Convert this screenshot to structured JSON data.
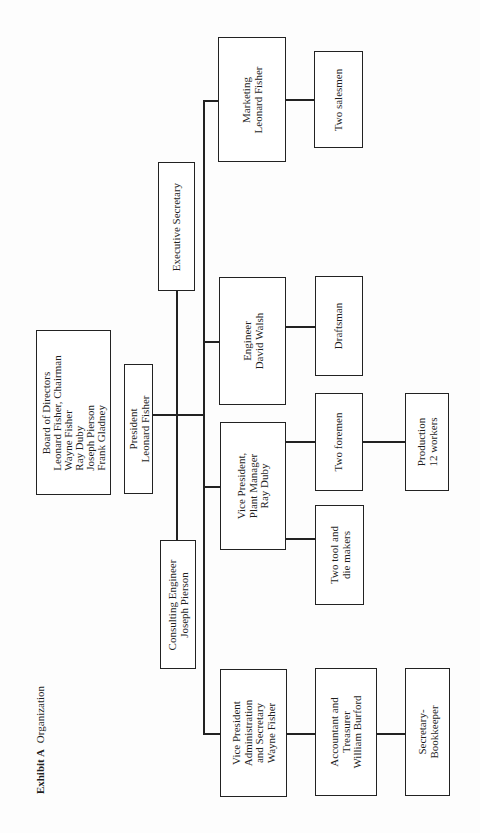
{
  "caption": {
    "label": "Exhibit A",
    "title": "Organization"
  },
  "nodes": {
    "board": {
      "title": "Board of Directors",
      "members": [
        "Leonard Fisher, Chairman",
        "Wayne Fisher",
        "Ray Duby",
        "Joseph Pierson",
        "Frank Gladney"
      ]
    },
    "president": {
      "lines": [
        "President",
        "Leonard Fisher"
      ]
    },
    "executive_secretary": {
      "lines": [
        "Executive Secretary"
      ]
    },
    "consulting_engineer": {
      "lines": [
        "Consulting Engineer",
        "Joseph Pierson"
      ]
    },
    "marketing": {
      "lines": [
        "Marketing",
        "Leonard Fisher"
      ]
    },
    "salesmen": {
      "lines": [
        "Two salesmen"
      ]
    },
    "engineer": {
      "lines": [
        "Engineer",
        "David Walsh"
      ]
    },
    "draftsman": {
      "lines": [
        "Draftsman"
      ]
    },
    "vp_plant": {
      "lines": [
        "Vice President,",
        "Plant Manager",
        "Ray Duby"
      ]
    },
    "foremen": {
      "lines": [
        "Two foremen"
      ]
    },
    "production": {
      "lines": [
        "Production",
        "12 workers"
      ]
    },
    "tool_die": {
      "lines": [
        "Two tool and",
        "die makers"
      ]
    },
    "vp_admin": {
      "lines": [
        "Vice President",
        "Administration",
        "and Secretary",
        "Wayne Fisher"
      ]
    },
    "accountant": {
      "lines": [
        "Accountant and",
        "Treasurer",
        "William Burford"
      ]
    },
    "bookkeeper": {
      "lines": [
        "Secretary-",
        "Bookkeeper"
      ]
    }
  },
  "hierarchy": {
    "Board of Directors": [
      "President"
    ],
    "President": [
      "Executive Secretary",
      "Consulting Engineer",
      "Marketing",
      "Engineer",
      "Vice President, Plant Manager",
      "Vice President Administration and Secretary"
    ],
    "Marketing": [
      "Two salesmen"
    ],
    "Engineer": [
      "Draftsman"
    ],
    "Vice President, Plant Manager": [
      "Two foremen",
      "Two tool and die makers"
    ],
    "Two foremen": [
      "Production"
    ],
    "Vice President Administration and Secretary": [
      "Accountant and Treasurer"
    ],
    "Accountant and Treasurer": [
      "Secretary-Bookkeeper"
    ]
  },
  "colors": {
    "line": "#222222",
    "background": "#ffffff",
    "text": "#1e1e1e"
  }
}
